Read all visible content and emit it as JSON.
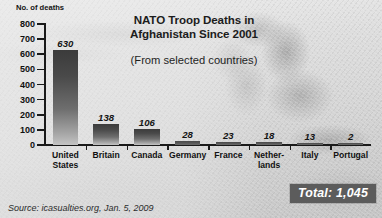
{
  "chart_data": {
    "type": "bar",
    "title": "NATO Troop Deaths in Afghanistan Since 2001",
    "title_line1": "NATO Troop Deaths in",
    "title_line2": "Afghanistan Since 2001",
    "subtitle": "(From selected countries)",
    "ylabel": "No. of deaths",
    "xlabel": "",
    "ylim": [
      0,
      800
    ],
    "ytick_step": 100,
    "yticks": [
      800,
      700,
      600,
      500,
      400,
      300,
      200,
      100,
      0
    ],
    "ytick_labels": [
      "800",
      "700",
      "600",
      "500",
      "400",
      "300",
      "200",
      "100",
      "0"
    ],
    "grid": false,
    "legend": "none",
    "categories": [
      "United States",
      "Britain",
      "Canada",
      "Germany",
      "France",
      "Netherlands",
      "Italy",
      "Portugal"
    ],
    "category_labels": [
      "United\nStates",
      "Britain",
      "Canada",
      "Germany",
      "France",
      "Nether-\nlands",
      "Italy",
      "Portugal"
    ],
    "values": [
      630,
      138,
      106,
      28,
      23,
      18,
      13,
      2
    ],
    "value_labels": [
      "630",
      "138",
      "106",
      "28",
      "23",
      "18",
      "13",
      "2"
    ],
    "annotations": {
      "total": "Total: 1,045",
      "total_value": 1045
    },
    "source": "Source: icasualties.org, Jan. 5, 2009",
    "colors": {
      "bar_top": "#3b3b3b",
      "bar_bottom": "#c4c4c4",
      "axis": "#1a1a1a",
      "text": "#111111",
      "total_badge_bg": "#5c5c5c",
      "total_badge_text": "#ffffff",
      "background": "#d2d2d2"
    }
  }
}
